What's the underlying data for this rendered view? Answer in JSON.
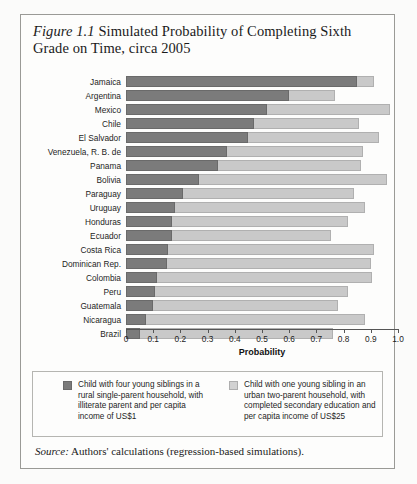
{
  "title": {
    "figure_number": "Figure 1.1",
    "text": "Simulated Probability of Completing Sixth Grade on Time, circa 2005"
  },
  "source": {
    "label": "Source:",
    "text": "Authors' calculations (regression-based simulations)."
  },
  "legend": {
    "items": [
      {
        "swatch": "dark",
        "label": "Child with four young siblings in a rural single-parent household, with illiterate parent and per capita income of US$1"
      },
      {
        "swatch": "light",
        "label": "Child with one young sibling in an urban two-parent household, with completed secondary education and per capita income of US$25"
      }
    ]
  },
  "chart_data": {
    "type": "bar",
    "orientation": "horizontal",
    "stacked": true,
    "title": "Figure 1.1 Simulated Probability of Completing Sixth Grade on Time, circa 2005",
    "xlabel": "Probability",
    "ylabel": "",
    "xlim": [
      0,
      1.0
    ],
    "xticks": [
      0,
      0.1,
      0.2,
      0.3,
      0.4,
      0.5,
      0.6,
      0.7,
      0.8,
      0.9,
      1.0
    ],
    "xticklabels": [
      "0",
      "0.1",
      "0.2",
      "0.3",
      "0.4",
      "0.5",
      "0.6",
      "0.7",
      "0.8",
      "0.9",
      "1.0"
    ],
    "grid": false,
    "legend_position": "below",
    "categories": [
      "Jamaica",
      "Argentina",
      "Mexico",
      "Chile",
      "El Salvador",
      "Venezuela, R. B. de",
      "Panama",
      "Bolivia",
      "Paraguay",
      "Uruguay",
      "Honduras",
      "Ecuador",
      "Costa Rica",
      "Dominican Rep.",
      "Colombia",
      "Peru",
      "Guatemala",
      "Nicaragua",
      "Brazil"
    ],
    "series": [
      {
        "name": "Child with four young siblings in a rural single-parent household, with illiterate parent and per capita income of US$1",
        "color": "#7b7b7b",
        "values": [
          0.85,
          0.6,
          0.52,
          0.47,
          0.45,
          0.37,
          0.34,
          0.27,
          0.21,
          0.18,
          0.17,
          0.17,
          0.155,
          0.15,
          0.115,
          0.105,
          0.1,
          0.075,
          0.05
        ]
      },
      {
        "name": "Child with one young sibling in an urban two-parent household, with completed secondary education and per capita income of US$25",
        "color": "#c9c9c9",
        "values": [
          0.06,
          0.17,
          0.45,
          0.385,
          0.48,
          0.5,
          0.525,
          0.69,
          0.63,
          0.7,
          0.645,
          0.585,
          0.755,
          0.75,
          0.79,
          0.71,
          0.68,
          0.805,
          0.71
        ]
      }
    ],
    "totals": [
      0.91,
      0.77,
      0.97,
      0.855,
      0.93,
      0.87,
      0.865,
      0.96,
      0.84,
      0.88,
      0.815,
      0.755,
      0.91,
      0.9,
      0.905,
      0.815,
      0.78,
      0.88,
      0.76
    ]
  },
  "colors": {
    "dark_segment": "#7b7b7b",
    "light_segment": "#c9c9c9",
    "axis": "#555555",
    "border": "#9a9a96",
    "text": "#1d1d1d"
  }
}
